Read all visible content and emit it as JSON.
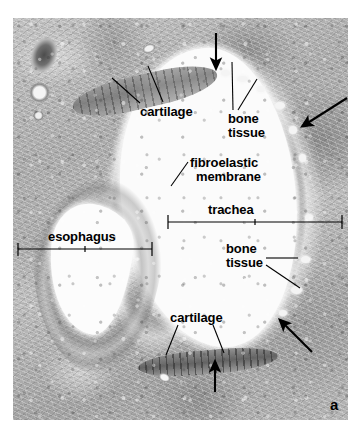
{
  "figure": {
    "panel_letter": "a",
    "specimen": "transverse histological section of trachea and esophagus",
    "stain_palette": "grayscale-histology",
    "background_color": "#ffffff",
    "annotation_color": "#000000"
  },
  "labels": [
    {
      "id": "cartilage-top",
      "text": "cartilage",
      "x": 140,
      "y": 105
    },
    {
      "id": "bone-tissue-top",
      "text": "bone",
      "x": 228,
      "y": 113
    },
    {
      "id": "bone-tissue-top2",
      "text": "tissue",
      "x": 228,
      "y": 126
    },
    {
      "id": "fibroelastic",
      "text": "fibroelastic",
      "x": 190,
      "y": 157
    },
    {
      "id": "membrane",
      "text": "membrane",
      "x": 195,
      "y": 170
    },
    {
      "id": "trachea",
      "text": "trachea",
      "x": 208,
      "y": 203
    },
    {
      "id": "esophagus",
      "text": "esophagus",
      "x": 48,
      "y": 230
    },
    {
      "id": "bone-tissue-bot",
      "text": "bone",
      "x": 226,
      "y": 243
    },
    {
      "id": "bone-tissue-bot2",
      "text": "tissue",
      "x": 226,
      "y": 256
    },
    {
      "id": "cartilage-bottom",
      "text": "cartilage",
      "x": 170,
      "y": 311
    }
  ],
  "measure_bars": [
    {
      "id": "trachea-extent",
      "label_for": "trachea",
      "x1": 168,
      "y": 222,
      "x2": 342
    },
    {
      "id": "esophagus-extent",
      "label_for": "esophagus",
      "x1": 18,
      "y": 249,
      "x2": 152
    }
  ],
  "arrows": [
    {
      "id": "arrow-top",
      "direction": "down",
      "x1": 216,
      "y1": 33,
      "x2": 216,
      "y2": 66
    },
    {
      "id": "arrow-upper-right",
      "direction": "down-left",
      "x1": 347,
      "y1": 98,
      "x2": 304,
      "y2": 126
    },
    {
      "id": "arrow-lower-right",
      "direction": "up-left",
      "x1": 312,
      "y1": 352,
      "x2": 281,
      "y2": 321
    },
    {
      "id": "arrow-bottom",
      "direction": "up",
      "x1": 215,
      "y1": 392,
      "x2": 215,
      "y2": 364
    }
  ],
  "leader_lines": [
    {
      "id": "leader-cartilage-top-a",
      "for": "cartilage-top",
      "x1": 140,
      "y1": 103,
      "x2": 112,
      "y2": 78
    },
    {
      "id": "leader-cartilage-top-b",
      "for": "cartilage-top",
      "x1": 163,
      "y1": 102,
      "x2": 148,
      "y2": 66
    },
    {
      "id": "leader-bone-top-a",
      "for": "bone-tissue-top",
      "x1": 233,
      "y1": 110,
      "x2": 232,
      "y2": 62
    },
    {
      "id": "leader-bone-top-b",
      "for": "bone-tissue-top",
      "x1": 238,
      "y1": 110,
      "x2": 257,
      "y2": 79
    },
    {
      "id": "leader-fibroelastic",
      "for": "fibroelastic",
      "x1": 188,
      "y1": 162,
      "x2": 171,
      "y2": 186
    },
    {
      "id": "leader-bone-bot-a",
      "for": "bone-tissue-bot",
      "x1": 266,
      "y1": 258,
      "x2": 298,
      "y2": 258
    },
    {
      "id": "leader-bone-bot-b",
      "for": "bone-tissue-bot",
      "x1": 266,
      "y1": 265,
      "x2": 300,
      "y2": 288
    },
    {
      "id": "leader-cartilage-bot-a",
      "for": "cartilage-bottom",
      "x1": 178,
      "y1": 325,
      "x2": 166,
      "y2": 355
    },
    {
      "id": "leader-cartilage-bot-b",
      "for": "cartilage-bottom",
      "x1": 213,
      "y1": 325,
      "x2": 224,
      "y2": 353
    }
  ]
}
